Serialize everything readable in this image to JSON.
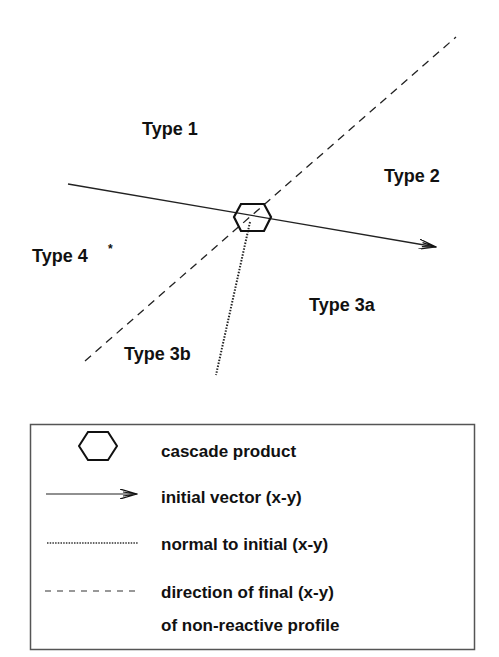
{
  "diagram": {
    "regions": [
      {
        "id": "type1",
        "label": "Type 1"
      },
      {
        "id": "type2",
        "label": "Type 2"
      },
      {
        "id": "type3a",
        "label": "Type 3a"
      },
      {
        "id": "type3b",
        "label": "Type 3b"
      },
      {
        "id": "type4",
        "label": "Type 4",
        "superscript": "*"
      }
    ],
    "center_symbol": "hexagon",
    "lines": {
      "initial_vector": {
        "style": "solid",
        "arrow": true
      },
      "normal_to_initial": {
        "style": "dotted"
      },
      "final_direction": {
        "style": "dashed"
      }
    }
  },
  "legend": {
    "items": [
      {
        "symbol": "hexagon-icon",
        "label": "cascade product"
      },
      {
        "symbol": "solid-arrow-icon",
        "label": "initial vector (x-y)"
      },
      {
        "symbol": "dotted-line-icon",
        "label": "normal to initial (x-y)"
      },
      {
        "symbol": "dashed-line-icon",
        "label": "direction of final (x-y)",
        "label_line2": "of non-reactive profile"
      }
    ]
  },
  "colors": {
    "ink": "#111111",
    "background": "#ffffff",
    "legend_border": "#555555"
  }
}
